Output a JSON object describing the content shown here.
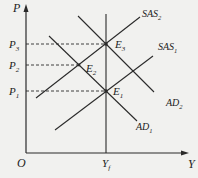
{
  "diagram": {
    "axes": {
      "y_label": "P",
      "x_label": "Y",
      "origin_label": "O"
    },
    "price_levels": [
      {
        "name": "P3",
        "base": "P",
        "sub": "3"
      },
      {
        "name": "P2",
        "base": "P",
        "sub": "2"
      },
      {
        "name": "P1",
        "base": "P",
        "sub": "1"
      }
    ],
    "output_level": {
      "base": "Y",
      "sub": "f"
    },
    "curves": {
      "sas2": {
        "base": "SAS",
        "sub": "2"
      },
      "sas1": {
        "base": "SAS",
        "sub": "1"
      },
      "ad2": {
        "base": "AD",
        "sub": "2"
      },
      "ad1": {
        "base": "AD",
        "sub": "1"
      }
    },
    "equilibria": {
      "e3": {
        "base": "E",
        "sub": "3"
      },
      "e2": {
        "base": "E",
        "sub": "2"
      },
      "e1": {
        "base": "E",
        "sub": "1"
      }
    },
    "colors": {
      "line": "#2a2a2a",
      "background": "#f1f1ef"
    }
  }
}
